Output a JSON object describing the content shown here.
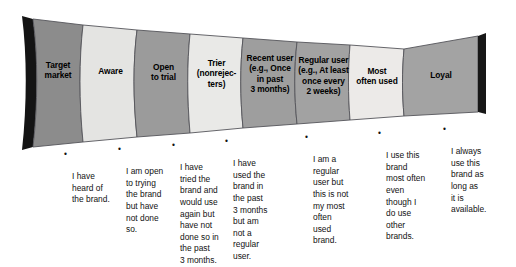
{
  "diagram": {
    "type": "brand-loyalty-funnel",
    "orientation": "horizontal-tapering-right",
    "palette": {
      "segment_dark": "#8c8c8c",
      "segment_light": "#e2e2e2",
      "edge_shadow": "#111111",
      "outline": "#4d4d4d",
      "text": "#000000",
      "background": "#ffffff"
    },
    "stages": [
      {
        "id": "target-market",
        "label": "Target\nmarket",
        "shade": "dark",
        "caption": null
      },
      {
        "id": "aware",
        "label": "Aware",
        "shade": "light",
        "caption": "I have\nheard of\nthe brand."
      },
      {
        "id": "open-to-trial",
        "label": "Open\nto trial",
        "shade": "dark",
        "caption": "I am open\nto trying\nthe brand\nbut have\nnot done\nso."
      },
      {
        "id": "trier",
        "label": "Trier\n(nonrejec-\nters)",
        "shade": "light",
        "caption": "I have\ntried the\nbrand and\nwould use\nagain but\nhave not\ndone so in\nthe past\n3 months."
      },
      {
        "id": "recent-user",
        "label": "Recent user\n(e.g., Once\nin past\n3 months)",
        "shade": "dark",
        "caption": "I have\nused the\nbrand in\nthe past\n3 months\nbut am\nnot a\nregular\nuser."
      },
      {
        "id": "regular-user",
        "label": "Regular user\n(e.g., At least\nonce every\n2 weeks)",
        "shade": "dark",
        "caption": "I am a\nregular\nuser but\nthis is not\nmy most\noften\nused\nbrand."
      },
      {
        "id": "most-often-used",
        "label": "Most\noften used",
        "shade": "light",
        "caption": "I use this\nbrand\nmost often\neven\nthough I\ndo use\nother\nbrands."
      },
      {
        "id": "loyal",
        "label": "Loyal",
        "shade": "dark",
        "caption": "I always\nuse this\nbrand as\nlong as\nit is\navailable."
      }
    ],
    "bullet_glyph": "•"
  }
}
